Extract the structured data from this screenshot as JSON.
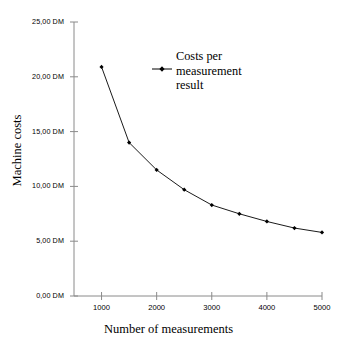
{
  "chart_data": {
    "type": "line",
    "title": "",
    "subtitle": "",
    "xlabel": "Number of measurements",
    "ylabel": "Machine costs",
    "xlim": [
      500,
      5000
    ],
    "ylim": [
      0,
      25
    ],
    "grid": false,
    "legend_position": "upper-right-inside",
    "x": [
      1000,
      1500,
      2000,
      2500,
      3000,
      3500,
      4000,
      4500,
      5000
    ],
    "series": [
      {
        "name": "Costs per measurement result",
        "values": [
          20.9,
          14.0,
          11.5,
          9.7,
          8.3,
          7.5,
          6.8,
          6.2,
          5.8
        ],
        "marker": "filled-diamond",
        "color": "#000000"
      }
    ],
    "x_ticks": [
      1000,
      2000,
      3000,
      4000,
      5000
    ],
    "x_tick_labels": [
      "1000",
      "2000",
      "3000",
      "4000",
      "5000"
    ],
    "y_ticks": [
      0,
      5,
      10,
      15,
      20,
      25
    ],
    "y_tick_labels": [
      "0,00 DM",
      "5,00 DM",
      "10,00 DM",
      "15,00 DM",
      "20,00 DM",
      "25,00 DM"
    ],
    "currency_suffix": "DM",
    "decimal_separator": ",",
    "annotations": []
  },
  "legend": {
    "line1": "Costs per",
    "line2": "measurement",
    "line3": "result"
  },
  "axes": {
    "x_title": "Number of measurements",
    "y_title": "Machine costs"
  },
  "colors": {
    "background": "#ffffff",
    "axis": "#767676",
    "series": "#000000",
    "text": "#000000"
  }
}
